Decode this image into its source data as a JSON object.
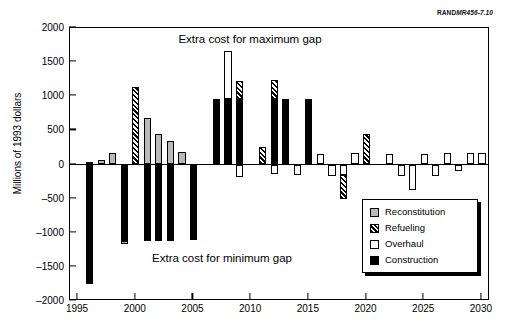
{
  "figure": {
    "credit_bold": "RAND",
    "credit_italic": "MR456-7.10",
    "ytitle": "Millions of 1993 dollars",
    "annotation_top": "Extra cost for maximum gap",
    "annotation_bottom": "Extra cost for minimum gap"
  },
  "legend": {
    "items": [
      {
        "label": "Reconstitution",
        "key": "reconstitution",
        "color": "#b9b9b9"
      },
      {
        "label": "Refueling",
        "key": "refueling",
        "color": "#000000"
      },
      {
        "label": "Overhaul",
        "key": "overhaul",
        "color": "#ffffff"
      },
      {
        "label": "Construction",
        "key": "construction",
        "color": "#000000"
      }
    ]
  },
  "chart_data": {
    "type": "bar",
    "title": "",
    "subtitle": "",
    "xlabel": "",
    "ylabel": "Millions of 1993 dollars",
    "xlim": [
      1994.3,
      2030.7
    ],
    "ylim": [
      -2000,
      2000
    ],
    "yticks": [
      -2000,
      -1500,
      -1000,
      -500,
      0,
      500,
      1000,
      1500,
      2000
    ],
    "xticks": [
      1995,
      2000,
      2005,
      2010,
      2015,
      2020,
      2025,
      2030
    ],
    "xtick_labels": [
      "1995",
      "2000",
      "2005",
      "2010",
      "2015",
      "2020",
      "2025",
      "2030"
    ],
    "ytick_labels": [
      "-2000",
      "-1500",
      "-1000",
      "-500",
      "0",
      "500",
      "1000",
      "1500",
      "2000"
    ],
    "grid": false,
    "stacked": true,
    "legend_position": "bottom-right",
    "annotations": [
      {
        "text": "Extra cost for maximum gap",
        "x": 2009,
        "y": 1810
      },
      {
        "text": "Extra cost for minimum gap",
        "x": 2006,
        "y": -1570
      }
    ],
    "series": [
      {
        "name": "Construction",
        "key": "construction"
      },
      {
        "name": "Refueling",
        "key": "refueling"
      },
      {
        "name": "Overhaul",
        "key": "overhaul"
      },
      {
        "name": "Reconstitution",
        "key": "reconstitution"
      }
    ],
    "categories": [
      1996,
      1997,
      1998,
      1999,
      2000,
      2001,
      2002,
      2003,
      2004,
      2005,
      2006,
      2007,
      2008,
      2009,
      2010,
      2011,
      2012,
      2013,
      2014,
      2015,
      2016,
      2017,
      2018,
      2019,
      2020,
      2021,
      2022,
      2023,
      2024,
      2025,
      2026,
      2027,
      2028,
      2029,
      2030
    ],
    "bars": [
      {
        "year": 1996,
        "positive": [
          {
            "key": "construction",
            "value": 30
          }
        ],
        "negative": [
          {
            "key": "construction",
            "value": -1750
          }
        ]
      },
      {
        "year": 1997,
        "positive": [
          {
            "key": "reconstitution",
            "value": 65
          }
        ],
        "negative": []
      },
      {
        "year": 1998,
        "positive": [
          {
            "key": "reconstitution",
            "value": 170
          }
        ],
        "negative": []
      },
      {
        "year": 1999,
        "positive": [],
        "negative": [
          {
            "key": "construction",
            "value": -1120
          },
          {
            "key": "reconstitution",
            "value": -40
          }
        ]
      },
      {
        "year": 2000,
        "positive": [
          {
            "key": "refueling",
            "value": 1130
          }
        ],
        "negative": []
      },
      {
        "year": 2001,
        "positive": [
          {
            "key": "reconstitution",
            "value": 685
          }
        ],
        "negative": [
          {
            "key": "construction",
            "value": -1120
          }
        ]
      },
      {
        "year": 2002,
        "positive": [
          {
            "key": "reconstitution",
            "value": 450
          }
        ],
        "negative": [
          {
            "key": "construction",
            "value": -1120
          }
        ]
      },
      {
        "year": 2003,
        "positive": [
          {
            "key": "reconstitution",
            "value": 350
          }
        ],
        "negative": [
          {
            "key": "construction",
            "value": -1120
          }
        ]
      },
      {
        "year": 2004,
        "positive": [
          {
            "key": "reconstitution",
            "value": 190
          }
        ],
        "negative": []
      },
      {
        "year": 2005,
        "positive": [],
        "negative": [
          {
            "key": "construction",
            "value": -1110
          }
        ]
      },
      {
        "year": 2006,
        "positive": [],
        "negative": []
      },
      {
        "year": 2007,
        "positive": [
          {
            "key": "construction",
            "value": 960
          }
        ],
        "negative": []
      },
      {
        "year": 2008,
        "positive": [
          {
            "key": "construction",
            "value": 955
          },
          {
            "key": "overhaul",
            "value": 705
          }
        ],
        "negative": []
      },
      {
        "year": 2009,
        "positive": [
          {
            "key": "construction",
            "value": 960
          },
          {
            "key": "refueling",
            "value": 260
          }
        ],
        "negative": [
          {
            "key": "overhaul",
            "value": -185
          }
        ]
      },
      {
        "year": 2010,
        "positive": [],
        "negative": []
      },
      {
        "year": 2011,
        "positive": [
          {
            "key": "refueling",
            "value": 255
          }
        ],
        "negative": []
      },
      {
        "year": 2012,
        "positive": [
          {
            "key": "construction",
            "value": 960
          },
          {
            "key": "refueling",
            "value": 280
          }
        ],
        "negative": [
          {
            "key": "overhaul",
            "value": -140
          }
        ]
      },
      {
        "year": 2013,
        "positive": [
          {
            "key": "construction",
            "value": 955
          }
        ],
        "negative": []
      },
      {
        "year": 2014,
        "positive": [],
        "negative": [
          {
            "key": "overhaul",
            "value": -160
          }
        ]
      },
      {
        "year": 2015,
        "positive": [
          {
            "key": "construction",
            "value": 960
          }
        ],
        "negative": []
      },
      {
        "year": 2016,
        "positive": [
          {
            "key": "overhaul",
            "value": 150
          }
        ],
        "negative": []
      },
      {
        "year": 2017,
        "positive": [],
        "negative": [
          {
            "key": "overhaul",
            "value": -175
          }
        ]
      },
      {
        "year": 2018,
        "positive": [],
        "negative": [
          {
            "key": "overhaul",
            "value": -160
          },
          {
            "key": "refueling",
            "value": -345
          }
        ]
      },
      {
        "year": 2019,
        "positive": [
          {
            "key": "overhaul",
            "value": 175
          }
        ],
        "negative": []
      },
      {
        "year": 2020,
        "positive": [
          {
            "key": "refueling",
            "value": 440
          }
        ],
        "negative": []
      },
      {
        "year": 2021,
        "positive": [],
        "negative": []
      },
      {
        "year": 2022,
        "positive": [
          {
            "key": "overhaul",
            "value": 150
          }
        ],
        "negative": []
      },
      {
        "year": 2023,
        "positive": [],
        "negative": [
          {
            "key": "overhaul",
            "value": -170
          }
        ]
      },
      {
        "year": 2024,
        "positive": [],
        "negative": [
          {
            "key": "overhaul",
            "value": -370
          }
        ]
      },
      {
        "year": 2025,
        "positive": [
          {
            "key": "overhaul",
            "value": 160
          }
        ],
        "negative": []
      },
      {
        "year": 2026,
        "positive": [],
        "negative": [
          {
            "key": "overhaul",
            "value": -175
          }
        ]
      },
      {
        "year": 2027,
        "positive": [
          {
            "key": "overhaul",
            "value": 175
          }
        ],
        "negative": []
      },
      {
        "year": 2028,
        "positive": [],
        "negative": [
          {
            "key": "overhaul",
            "value": -90
          }
        ]
      },
      {
        "year": 2029,
        "positive": [
          {
            "key": "overhaul",
            "value": 165
          }
        ],
        "negative": []
      },
      {
        "year": 2030,
        "positive": [
          {
            "key": "overhaul",
            "value": 170
          }
        ],
        "negative": []
      }
    ]
  }
}
